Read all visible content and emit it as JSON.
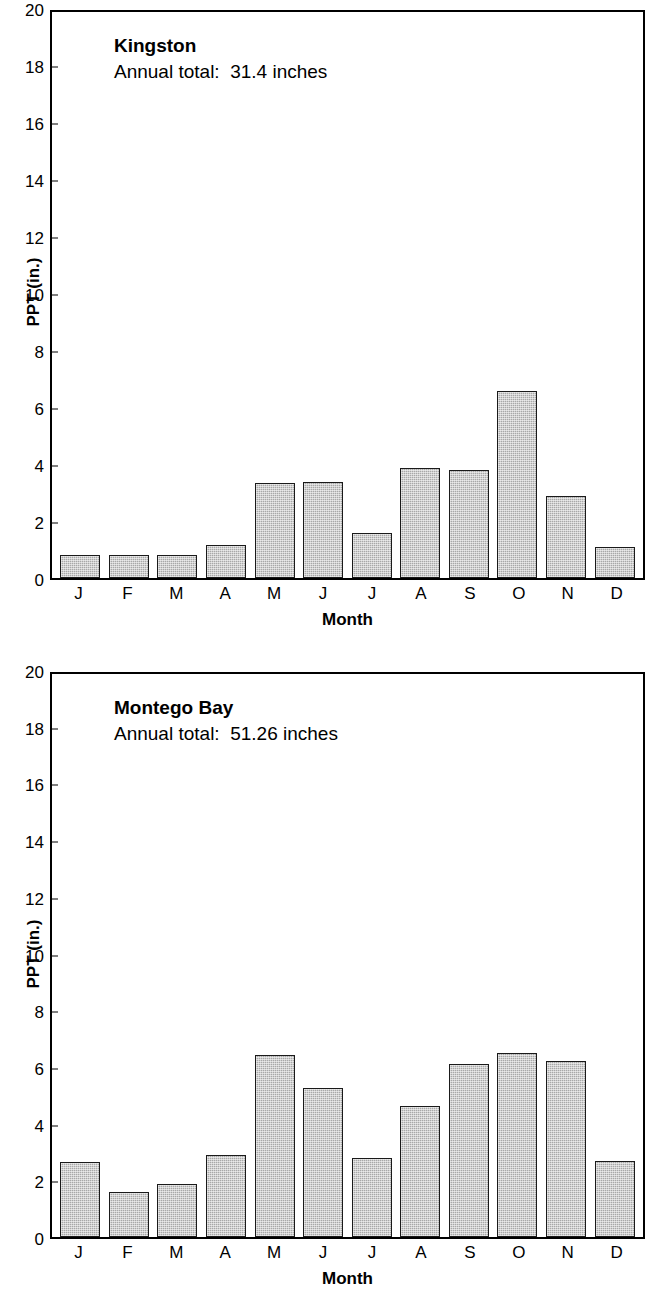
{
  "figure": {
    "axis_label_y": "PPT (in.)",
    "axis_label_x": "Month"
  },
  "chart_data": [
    {
      "type": "bar",
      "title": "Kingston",
      "subtitle": "Annual total:  31.4 inches",
      "annual_total": 31.4,
      "annual_total_units": "inches",
      "xlabel": "Month",
      "ylabel": "PPT (in.)",
      "ylim": [
        0,
        20
      ],
      "yticks": [
        0,
        2,
        4,
        6,
        8,
        10,
        12,
        14,
        16,
        18,
        20
      ],
      "grid": false,
      "legend": "none",
      "categories": [
        "J",
        "F",
        "M",
        "A",
        "M",
        "J",
        "J",
        "A",
        "S",
        "O",
        "N",
        "D"
      ],
      "values": [
        0.8,
        0.8,
        0.8,
        1.15,
        3.35,
        3.4,
        1.6,
        3.9,
        3.8,
        6.6,
        2.9,
        1.1
      ]
    },
    {
      "type": "bar",
      "title": "Montego Bay",
      "subtitle": "Annual total:  51.26 inches",
      "annual_total": 51.26,
      "annual_total_units": "inches",
      "xlabel": "Month",
      "ylabel": "PPT (in.)",
      "ylim": [
        0,
        20
      ],
      "yticks": [
        0,
        2,
        4,
        6,
        8,
        10,
        12,
        14,
        16,
        18,
        20
      ],
      "grid": false,
      "legend": "none",
      "categories": [
        "J",
        "F",
        "M",
        "A",
        "M",
        "J",
        "J",
        "A",
        "S",
        "O",
        "N",
        "D"
      ],
      "values": [
        2.65,
        1.6,
        1.9,
        2.9,
        6.45,
        5.3,
        2.8,
        4.65,
        6.15,
        6.55,
        6.25,
        2.7
      ]
    }
  ],
  "style": {
    "bar_fill": "#a8a8a8",
    "bar_stroke": "#1a1a1a",
    "axis_color": "#000000",
    "background": "#ffffff"
  }
}
